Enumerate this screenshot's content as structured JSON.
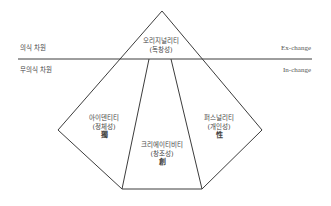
{
  "diagram": {
    "type": "layered-pyramid",
    "horizon": {
      "upper_label_left": "의식 차원",
      "upper_label_right": "Ex-change",
      "lower_label_left": "무의식 차원",
      "lower_label_right": "In-change"
    },
    "regions": {
      "top": {
        "title": "오리지널리티",
        "subtitle": "(독창성)"
      },
      "left": {
        "title": "아이덴티티",
        "subtitle": "(정체성)",
        "hanja": "獨"
      },
      "center": {
        "title": "크리에이티비티",
        "subtitle": "(창조성)",
        "hanja": "創"
      },
      "right": {
        "title": "퍼스널리티",
        "subtitle": "(개인성)",
        "hanja": "性"
      }
    },
    "colors": {
      "line": "#3c3c3c",
      "text": "#444444",
      "background": "#ffffff"
    }
  }
}
